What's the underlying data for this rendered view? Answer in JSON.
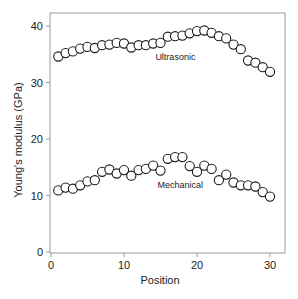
{
  "chart_data": {
    "type": "scatter",
    "title": "",
    "xlabel": "Position",
    "ylabel": "Young's modulus (GPa)",
    "xlim": [
      0,
      31
    ],
    "ylim": [
      0,
      42
    ],
    "xticks": [
      0,
      10,
      20,
      30
    ],
    "yticks": [
      0,
      10,
      20,
      30,
      40
    ],
    "grid": false,
    "legend": "none (series labeled inline)",
    "marker": "open-circle",
    "x": [
      1,
      2,
      3,
      4,
      5,
      6,
      7,
      8,
      9,
      10,
      11,
      12,
      13,
      14,
      15,
      16,
      17,
      18,
      19,
      20,
      21,
      22,
      23,
      24,
      25,
      26,
      27,
      28,
      29,
      30
    ],
    "series": [
      {
        "name": "Ultrasonic",
        "label_position": {
          "x": 14.3,
          "y": 33.9
        },
        "values": [
          34.6,
          35.2,
          35.5,
          36.0,
          36.3,
          36.1,
          36.6,
          36.7,
          37.0,
          36.9,
          36.2,
          36.6,
          36.6,
          36.9,
          37.0,
          38.1,
          38.2,
          38.3,
          38.7,
          39.1,
          39.2,
          38.8,
          38.2,
          37.8,
          36.7,
          35.9,
          33.9,
          33.5,
          32.7,
          31.9
        ]
      },
      {
        "name": "Mechanical",
        "label_position": {
          "x": 14.6,
          "y": 11.3
        },
        "values": [
          10.9,
          11.4,
          11.2,
          11.8,
          12.5,
          12.7,
          14.2,
          14.6,
          13.9,
          14.5,
          13.5,
          14.5,
          14.7,
          15.3,
          14.4,
          16.5,
          16.8,
          16.8,
          15.2,
          14.2,
          15.3,
          14.7,
          12.7,
          13.7,
          12.3,
          11.8,
          11.8,
          11.6,
          10.6,
          9.8
        ]
      }
    ],
    "colors": {
      "axis": "#9a9a9a",
      "marker_stroke": "#1a1a1a",
      "marker_fill": "#ffffff",
      "text": "#222222"
    }
  }
}
